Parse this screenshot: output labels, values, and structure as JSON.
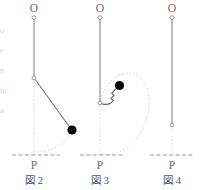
{
  "page": {
    "kind": "physics-figure-panel",
    "width": 199,
    "height": 190,
    "background": "#ffffff",
    "ink": "#6b6b6b",
    "ball_color": "#000000",
    "dotted_color": "#c9c9c9"
  },
  "figures": [
    {
      "id": "fig2",
      "caption": "図 2",
      "pivot_label": "O",
      "base_label": "P",
      "rod_style": "straight-diagonal",
      "pivot": {
        "x": 34,
        "y": 16
      },
      "joint": {
        "x": 34,
        "y": 78
      },
      "bob": {
        "x": 72,
        "y": 130
      },
      "baseline_y": 155,
      "baseline_x1": 12,
      "baseline_x2": 60,
      "arc_label": "dotted swing arc"
    },
    {
      "id": "fig3",
      "caption": "図 3",
      "pivot_label": "O",
      "base_label": "P",
      "rod_style": "wavy-zigzag",
      "pivot": {
        "x": 100,
        "y": 16
      },
      "joint": {
        "x": 100,
        "y": 103
      },
      "bob": {
        "x": 119,
        "y": 86
      },
      "baseline_y": 155,
      "baseline_x1": 80,
      "baseline_x2": 124,
      "arc_label": "dotted swing arc"
    },
    {
      "id": "fig4",
      "caption": "図 4",
      "pivot_label": "O",
      "base_label": "P",
      "rod_style": "straight-vertical",
      "pivot": {
        "x": 172,
        "y": 16
      },
      "joint": {
        "x": 172,
        "y": 125
      },
      "bob": null,
      "baseline_y": 155,
      "baseline_x1": 150,
      "baseline_x2": 194,
      "arc_label": "none"
    }
  ],
  "edge_fragments": {
    "note": "cut-off glyph fragments at left margin",
    "glyphs": [
      "-",
      "o",
      "e",
      "n",
      "m",
      "a",
      "",
      "",
      "",
      "",
      "",
      "",
      "",
      "",
      "",
      "",
      "",
      "",
      ""
    ]
  }
}
